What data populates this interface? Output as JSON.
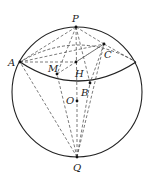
{
  "diagram": {
    "type": "sphere-geometry",
    "colors": {
      "line": "#222222",
      "background": "#ffffff"
    },
    "sphere": {
      "center_label": "O"
    },
    "points": {
      "P": "P",
      "Q": "Q",
      "A": "A",
      "B": "B",
      "C": "C",
      "M": "M",
      "H": "H",
      "O": "O"
    }
  }
}
